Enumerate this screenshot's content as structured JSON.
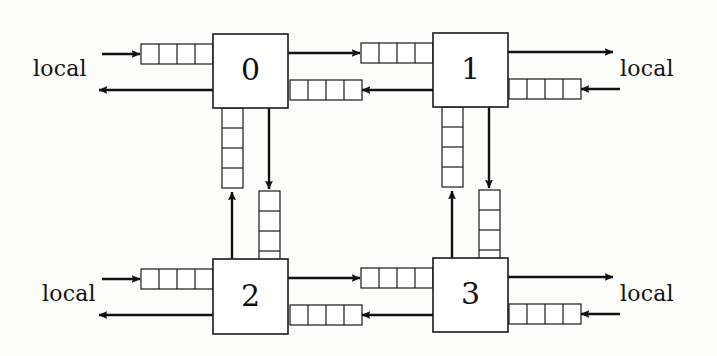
{
  "figure": {
    "type": "network-topology-diagram",
    "background_color": "#fdfdfc",
    "line_color": "#111111",
    "node_fill": "#ffffff"
  },
  "nodes": [
    {
      "id": "node-0",
      "label": "0",
      "x": 213,
      "y": 34,
      "w": 75,
      "h": 74
    },
    {
      "id": "node-1",
      "label": "1",
      "x": 433,
      "y": 33,
      "w": 75,
      "h": 74
    },
    {
      "id": "node-2",
      "label": "2",
      "x": 213,
      "y": 259,
      "w": 75,
      "h": 75
    },
    {
      "id": "node-3",
      "label": "3",
      "x": 433,
      "y": 258,
      "w": 75,
      "h": 74
    }
  ],
  "labels": [
    {
      "id": "local-top-left",
      "text": "local",
      "x": 33,
      "y": 56
    },
    {
      "id": "local-top-right",
      "text": "local",
      "x": 620,
      "y": 56
    },
    {
      "id": "local-bottom-left",
      "text": "local",
      "x": 42,
      "y": 281
    },
    {
      "id": "local-bottom-right",
      "text": "local",
      "x": 620,
      "y": 281
    }
  ],
  "queues": [
    {
      "id": "queue-local-in-0",
      "orientation": "horizontal",
      "cells": 4,
      "x": 141,
      "y": 44,
      "cell": 18,
      "thickness": 20
    },
    {
      "id": "queue-0-to-1",
      "orientation": "horizontal",
      "cells": 4,
      "x": 361,
      "y": 43,
      "cell": 18,
      "thickness": 20
    },
    {
      "id": "queue-1-to-0",
      "orientation": "horizontal",
      "cells": 4,
      "x": 290,
      "y": 80,
      "cell": 18,
      "thickness": 20
    },
    {
      "id": "queue-local-in-1",
      "orientation": "horizontal",
      "cells": 4,
      "x": 509,
      "y": 79,
      "cell": 18,
      "thickness": 20
    },
    {
      "id": "queue-local-in-2",
      "orientation": "horizontal",
      "cells": 4,
      "x": 141,
      "y": 269,
      "cell": 18,
      "thickness": 20
    },
    {
      "id": "queue-2-to-3",
      "orientation": "horizontal",
      "cells": 4,
      "x": 361,
      "y": 268,
      "cell": 18,
      "thickness": 20
    },
    {
      "id": "queue-3-to-2",
      "orientation": "horizontal",
      "cells": 4,
      "x": 290,
      "y": 305,
      "cell": 18,
      "thickness": 20
    },
    {
      "id": "queue-local-in-3",
      "orientation": "horizontal",
      "cells": 4,
      "x": 509,
      "y": 304,
      "cell": 18,
      "thickness": 20
    },
    {
      "id": "queue-2-to-0",
      "orientation": "vertical",
      "cells": 4,
      "x": 222,
      "y": 108,
      "cell": 20,
      "thickness": 21
    },
    {
      "id": "queue-0-to-2",
      "orientation": "vertical",
      "cells": 4,
      "x": 259,
      "y": 191,
      "cell": 20,
      "thickness": 21
    },
    {
      "id": "queue-3-to-1",
      "orientation": "vertical",
      "cells": 4,
      "x": 442,
      "y": 107,
      "cell": 20,
      "thickness": 21
    },
    {
      "id": "queue-1-to-3",
      "orientation": "vertical",
      "cells": 4,
      "x": 479,
      "y": 190,
      "cell": 20,
      "thickness": 21
    }
  ],
  "arrows": [
    {
      "id": "arrow-local-into-0",
      "x1": 102,
      "y1": 54,
      "x2": 140,
      "y2": 54
    },
    {
      "id": "arrow-0-out-local",
      "x1": 213,
      "y1": 90,
      "x2": 99,
      "y2": 90
    },
    {
      "id": "arrow-0-to-queue-1",
      "x1": 288,
      "y1": 53,
      "x2": 360,
      "y2": 53
    },
    {
      "id": "arrow-1-to-queue-0",
      "x1": 433,
      "y1": 90,
      "x2": 362,
      "y2": 90
    },
    {
      "id": "arrow-1-out-local",
      "x1": 508,
      "y1": 52,
      "x2": 613,
      "y2": 52
    },
    {
      "id": "arrow-local-into-1",
      "x1": 620,
      "y1": 89,
      "x2": 581,
      "y2": 89
    },
    {
      "id": "arrow-local-into-2",
      "x1": 102,
      "y1": 279,
      "x2": 140,
      "y2": 279
    },
    {
      "id": "arrow-2-out-local",
      "x1": 213,
      "y1": 315,
      "x2": 99,
      "y2": 315
    },
    {
      "id": "arrow-2-to-queue-3",
      "x1": 288,
      "y1": 278,
      "x2": 360,
      "y2": 278
    },
    {
      "id": "arrow-3-to-queue-2",
      "x1": 433,
      "y1": 315,
      "x2": 362,
      "y2": 315
    },
    {
      "id": "arrow-3-out-local",
      "x1": 508,
      "y1": 277,
      "x2": 613,
      "y2": 277
    },
    {
      "id": "arrow-local-into-3",
      "x1": 620,
      "y1": 314,
      "x2": 581,
      "y2": 314
    },
    {
      "id": "arrow-2-up-to-queue-0",
      "x1": 232,
      "y1": 259,
      "x2": 232,
      "y2": 192
    },
    {
      "id": "arrow-0-down-to-queue-2",
      "x1": 269,
      "y1": 108,
      "x2": 269,
      "y2": 189
    },
    {
      "id": "arrow-3-up-to-queue-1",
      "x1": 452,
      "y1": 258,
      "x2": 452,
      "y2": 191
    },
    {
      "id": "arrow-1-down-to-queue-3",
      "x1": 489,
      "y1": 107,
      "x2": 489,
      "y2": 188
    }
  ]
}
